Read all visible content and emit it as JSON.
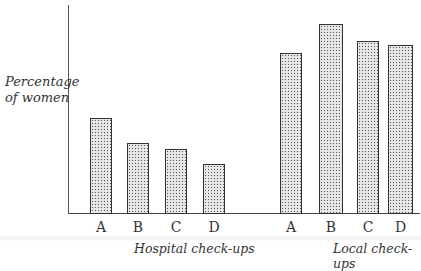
{
  "chart_data": {
    "type": "bar",
    "title": "",
    "xlabel": "",
    "ylabel": "Percentage of women",
    "ylabel_lines": [
      "Percentage",
      "of women"
    ],
    "y_scale_note": "no numeric scale shown; values are relative bar heights (axis height = 100)",
    "ylim": [
      0,
      100
    ],
    "grid": false,
    "legend": null,
    "groups": [
      {
        "name": "Hospital check-ups",
        "categories": [
          "A",
          "B",
          "C",
          "D"
        ],
        "values": [
          46,
          34,
          31,
          24
        ]
      },
      {
        "name": "Local check-ups",
        "categories": [
          "A",
          "B",
          "C",
          "D"
        ],
        "values": [
          77,
          91,
          83,
          81
        ]
      }
    ]
  },
  "layout": {
    "baseline_y": 214,
    "axis_height_px": 209,
    "bars": [
      {
        "group": 0,
        "label": "A",
        "x": 90,
        "w": 22
      },
      {
        "group": 0,
        "label": "B",
        "x": 127,
        "w": 22
      },
      {
        "group": 0,
        "label": "C",
        "x": 165,
        "w": 22
      },
      {
        "group": 0,
        "label": "D",
        "x": 203,
        "w": 22
      },
      {
        "group": 1,
        "label": "A",
        "x": 280,
        "w": 22
      },
      {
        "group": 1,
        "label": "B",
        "x": 319,
        "w": 24
      },
      {
        "group": 1,
        "label": "C",
        "x": 357,
        "w": 22
      },
      {
        "group": 1,
        "label": "D",
        "x": 388,
        "w": 25
      }
    ],
    "group_label_x": [
      134,
      333
    ]
  }
}
